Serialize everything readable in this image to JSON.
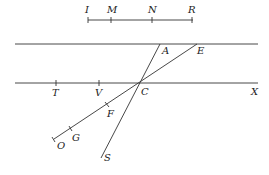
{
  "diagram": {
    "type": "geometry",
    "scale_segment": {
      "y": 20,
      "x1": 88,
      "x2": 193,
      "points": [
        {
          "label": "I",
          "x": 88
        },
        {
          "label": "M",
          "x": 111
        },
        {
          "label": "N",
          "x": 152
        },
        {
          "label": "R",
          "x": 192
        }
      ]
    },
    "parallel_lines": [
      {
        "name": "top-line",
        "y": 44,
        "x1": 15,
        "x2": 258
      },
      {
        "name": "bottom-line",
        "y": 83,
        "x1": 15,
        "x2": 258
      }
    ],
    "transversals": [
      {
        "name": "line-A-S",
        "from": "A",
        "to": "S"
      },
      {
        "name": "line-E-O",
        "from": "E",
        "to": "O"
      }
    ],
    "points": {
      "A": {
        "label": "A",
        "x": 160,
        "y": 44
      },
      "E": {
        "label": "E",
        "x": 197,
        "y": 44
      },
      "C": {
        "label": "C",
        "x": 141,
        "y": 83
      },
      "T": {
        "label": "T",
        "x": 56,
        "y": 83
      },
      "V": {
        "label": "V",
        "x": 99,
        "y": 83
      },
      "X": {
        "label": "X",
        "x": 258,
        "y": 83
      },
      "F": {
        "label": "F",
        "x": 107,
        "y": 105
      },
      "G": {
        "label": "G",
        "x": 71,
        "y": 128
      },
      "O": {
        "label": "O",
        "x": 54,
        "y": 139
      },
      "S": {
        "label": "S",
        "x": 101,
        "y": 158
      }
    }
  }
}
